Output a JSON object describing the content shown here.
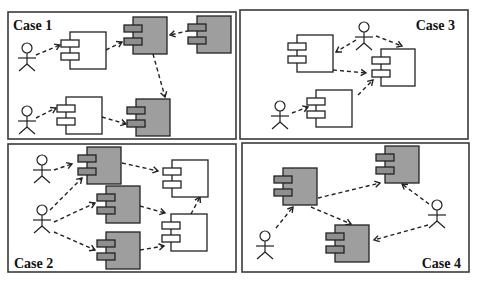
{
  "figure": {
    "colors": {
      "shaded_component": "#9e9e9e",
      "plain_component": "#ffffff",
      "stroke": "#222222",
      "panel_border": "#3a3a3a"
    }
  },
  "panels": [
    {
      "id": "case1",
      "label": "Case 1",
      "rect": [
        8,
        12,
        228,
        127
      ],
      "label_pos": [
        13,
        30,
        "start"
      ],
      "actors": [
        [
          27,
          55
        ],
        [
          27,
          118
        ]
      ],
      "components": [
        {
          "x": 70,
          "y": 32,
          "w": 36,
          "h": 37,
          "shaded": false
        },
        {
          "x": 133,
          "y": 17,
          "w": 34,
          "h": 37,
          "shaded": true
        },
        {
          "x": 197,
          "y": 16,
          "w": 34,
          "h": 37,
          "shaded": true
        },
        {
          "x": 66,
          "y": 97,
          "w": 36,
          "h": 37,
          "shaded": false
        },
        {
          "x": 136,
          "y": 99,
          "w": 34,
          "h": 37,
          "shaded": true
        }
      ],
      "edges": [
        [
          [
            36,
            55
          ],
          [
            60,
            45
          ]
        ],
        [
          [
            106,
            50
          ],
          [
            122,
            42
          ]
        ],
        [
          [
            196,
            29
          ],
          [
            170,
            35
          ]
        ],
        [
          [
            153,
            54
          ],
          [
            165,
            97
          ]
        ],
        [
          [
            36,
            118
          ],
          [
            56,
            108
          ]
        ],
        [
          [
            102,
            117
          ],
          [
            126,
            124
          ]
        ]
      ]
    },
    {
      "id": "case3",
      "label": "Case 3",
      "rect": [
        240,
        10,
        228,
        129
      ],
      "label_pos": [
        455,
        30,
        "end"
      ],
      "actors": [
        [
          364,
          34
        ],
        [
          280,
          113
        ]
      ],
      "components": [
        {
          "x": 297,
          "y": 35,
          "w": 36,
          "h": 37,
          "shaded": false
        },
        {
          "x": 381,
          "y": 49,
          "w": 34,
          "h": 37,
          "shaded": false
        },
        {
          "x": 316,
          "y": 90,
          "w": 36,
          "h": 37,
          "shaded": false
        }
      ],
      "edges": [
        [
          [
            356,
            40
          ],
          [
            336,
            52
          ]
        ],
        [
          [
            376,
            36
          ],
          [
            402,
            46
          ]
        ],
        [
          [
            333,
            70
          ],
          [
            366,
            73
          ]
        ],
        [
          [
            358,
            95
          ],
          [
            373,
            80
          ]
        ],
        [
          [
            292,
            113
          ],
          [
            308,
            107
          ]
        ]
      ]
    },
    {
      "id": "case2",
      "label": "Case 2",
      "rect": [
        8,
        144,
        228,
        128
      ],
      "label_pos": [
        14,
        268,
        "start"
      ],
      "actors": [
        [
          42,
          167
        ],
        [
          42,
          217
        ]
      ],
      "components": [
        {
          "x": 87,
          "y": 147,
          "w": 34,
          "h": 37,
          "shaded": true
        },
        {
          "x": 106,
          "y": 186,
          "w": 34,
          "h": 37,
          "shaded": true
        },
        {
          "x": 106,
          "y": 232,
          "w": 34,
          "h": 37,
          "shaded": true
        },
        {
          "x": 172,
          "y": 160,
          "w": 36,
          "h": 37,
          "shaded": false
        },
        {
          "x": 171,
          "y": 214,
          "w": 36,
          "h": 37,
          "shaded": false
        }
      ],
      "edges": [
        [
          [
            54,
            170
          ],
          [
            72,
            164
          ]
        ],
        [
          [
            50,
            210
          ],
          [
            82,
            178
          ]
        ],
        [
          [
            54,
            222
          ],
          [
            95,
            203
          ]
        ],
        [
          [
            54,
            232
          ],
          [
            95,
            250
          ]
        ],
        [
          [
            122,
            163
          ],
          [
            158,
            171
          ]
        ],
        [
          [
            140,
            206
          ],
          [
            165,
            213
          ]
        ],
        [
          [
            140,
            250
          ],
          [
            164,
            246
          ]
        ],
        [
          [
            191,
            214
          ],
          [
            200,
            197
          ]
        ]
      ]
    },
    {
      "id": "case4",
      "label": "Case 4",
      "rect": [
        242,
        143,
        227,
        129
      ],
      "label_pos": [
        461,
        268,
        "end"
      ],
      "actors": [
        [
          265,
          243
        ],
        [
          437,
          212
        ]
      ],
      "components": [
        {
          "x": 283,
          "y": 168,
          "w": 34,
          "h": 37,
          "shaded": true
        },
        {
          "x": 385,
          "y": 146,
          "w": 34,
          "h": 37,
          "shaded": true
        },
        {
          "x": 335,
          "y": 225,
          "w": 34,
          "h": 37,
          "shaded": true
        }
      ],
      "edges": [
        [
          [
            276,
            228
          ],
          [
            293,
            207
          ]
        ],
        [
          [
            318,
            198
          ],
          [
            380,
            183
          ]
        ],
        [
          [
            311,
            207
          ],
          [
            351,
            224
          ]
        ],
        [
          [
            429,
            204
          ],
          [
            402,
            184
          ]
        ],
        [
          [
            428,
            225
          ],
          [
            374,
            240
          ]
        ]
      ]
    }
  ]
}
